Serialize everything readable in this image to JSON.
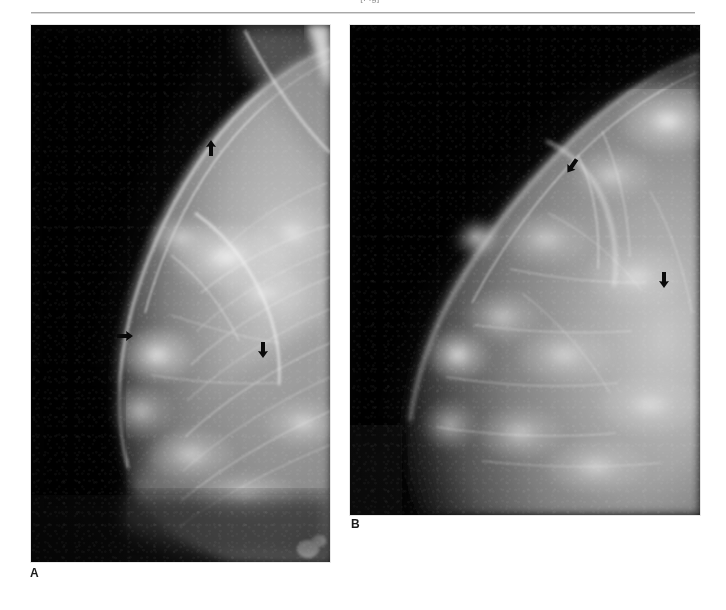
{
  "page": {
    "running_head": "[Fig]",
    "background_color": "#ffffff",
    "width": 726,
    "height": 610
  },
  "figure": {
    "panels": [
      {
        "id": "A",
        "label": "A",
        "modality": "mammogram",
        "view": "mediolateral oblique (MLO)",
        "description": "Left breast mammogram, dark radiolucent background with dense fibroglandular tissue arcing from the upper right; pectoral muscle line along the upper right margin.",
        "arrows": [
          {
            "name": "arrow-a-1",
            "direction": "down",
            "x": 203,
            "y": 139
          },
          {
            "name": "arrow-a-2",
            "direction": "right",
            "x": 117,
            "y": 327
          },
          {
            "name": "arrow-a-3",
            "direction": "up",
            "x": 255,
            "y": 341
          }
        ]
      },
      {
        "id": "B",
        "label": "B",
        "modality": "mammogram",
        "view": "craniocaudal (CC)",
        "description": "Companion craniocaudal view, breast contour sweeping from the left margin with heterogeneously dense glandular tissue.",
        "arrows": [
          {
            "name": "arrow-b-1",
            "direction": "down-left",
            "x": 564,
            "y": 157
          },
          {
            "name": "arrow-b-2",
            "direction": "up",
            "x": 656,
            "y": 271
          }
        ]
      }
    ]
  },
  "colors": {
    "film_black": "#050505",
    "tissue_white": "#f2f2f2",
    "arrow_black": "#0a0a0a",
    "rule_gray": "#a8a8a8",
    "page_white": "#ffffff"
  }
}
